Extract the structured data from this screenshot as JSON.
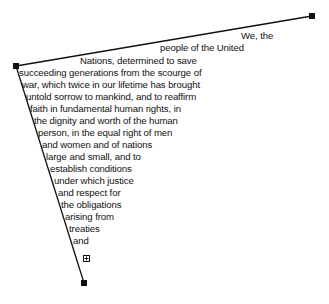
{
  "text_frame": {
    "lines": [
      "We, the",
      "people of the United",
      "Nations, determined to save",
      "succeeding generations from the scourge of",
      "war, which twice in our lifetime has brought",
      "untold sorrow to mankind, and to reaffirm",
      "faith in fundamental human rights, in",
      "the dignity and worth of the human",
      "person, in the equal right of men",
      "and women and of nations",
      "large and small, and to",
      "establish conditions",
      "under which justice",
      "and respect for",
      "the obligations",
      "arising from",
      "treaties",
      "and"
    ],
    "overflow_indicator": "+"
  },
  "colors": {
    "stroke": "#111111",
    "text": "#111111",
    "background": "#ffffff"
  }
}
